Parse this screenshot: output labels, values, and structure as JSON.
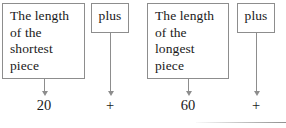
{
  "diagram": {
    "type": "flow-boxes-with-arrows",
    "line_color": "#8d8d8d",
    "text_color": "#1a1a1a",
    "background": "#ffffff",
    "boxes": [
      {
        "id": "shortest",
        "label": "The length\nof the\nshortest\npiece",
        "align": "left"
      },
      {
        "id": "plus-1",
        "label": "plus",
        "align": "center"
      },
      {
        "id": "longest",
        "label": "The length\nof the\nlongest\npiece",
        "align": "left"
      },
      {
        "id": "plus-2",
        "label": "plus",
        "align": "center"
      }
    ],
    "values": [
      {
        "id": "value-shortest",
        "label": "20"
      },
      {
        "id": "value-plus-1",
        "label": "+"
      },
      {
        "id": "value-longest",
        "label": "60"
      },
      {
        "id": "value-plus-2",
        "label": "+"
      }
    ]
  }
}
